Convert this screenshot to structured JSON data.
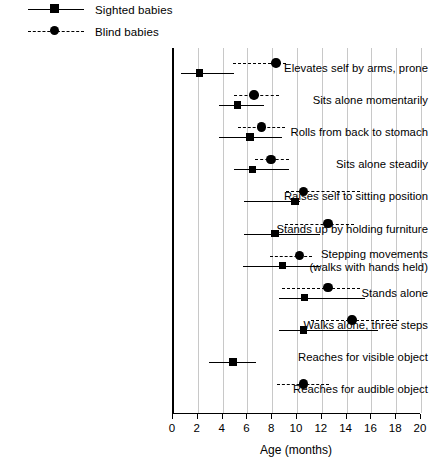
{
  "legend": {
    "position": "top-left",
    "entries": [
      {
        "label": "Sighted babies",
        "marker": "square",
        "line": "solid",
        "color": "#000000"
      },
      {
        "label": "Blind babies",
        "marker": "circle",
        "line": "dashed",
        "color": "#000000"
      }
    ]
  },
  "axis": {
    "xlabel": "Age (months)",
    "ticks": [
      "0",
      "2",
      "4",
      "6",
      "8",
      "10",
      "12",
      "14",
      "16",
      "18",
      "20"
    ]
  },
  "chart_data": {
    "type": "range-dot",
    "title": "",
    "xlabel": "Age (months)",
    "ylabel": "",
    "xlim": [
      0,
      20
    ],
    "grid": true,
    "legend_position": "top-left",
    "categories": [
      "Elevates self by arms, prone",
      "Sits alone momentarily",
      "Rolls from back to stomach",
      "Sits alone steadily",
      "Raises self to sitting position",
      "Stands up by holding furniture",
      "Stepping movements\n(walks with hands held)",
      "Stands alone",
      "Walks alone, three steps",
      "Reaches for visible object",
      "Reaches for audible object"
    ],
    "series": [
      {
        "name": "Sighted babies",
        "marker": "square",
        "line": "solid",
        "points": [
          {
            "category": "Elevates self by arms, prone",
            "median": 2.2,
            "low": 0.7,
            "high": 5.0
          },
          {
            "category": "Sits alone momentarily",
            "median": 5.3,
            "low": 3.8,
            "high": 7.4
          },
          {
            "category": "Rolls from back to stomach",
            "median": 6.3,
            "low": 3.8,
            "high": 8.9
          },
          {
            "category": "Sits alone steadily",
            "median": 6.5,
            "low": 5.0,
            "high": 9.4
          },
          {
            "category": "Raises self to sitting position",
            "median": 9.9,
            "low": 5.8,
            "high": 10.3
          },
          {
            "category": "Stands up by holding furniture",
            "median": 8.3,
            "low": 5.8,
            "high": 11.9
          },
          {
            "category": "Stepping movements\n(walks with hands held)",
            "median": 8.9,
            "low": 5.7,
            "high": 11.9
          },
          {
            "category": "Stands alone",
            "median": 10.7,
            "low": 8.6,
            "high": 15.6
          },
          {
            "category": "Walks alone, three steps",
            "median": 10.6,
            "low": 8.6,
            "high": 16.6
          },
          {
            "category": "Reaches for visible object",
            "median": 4.9,
            "low": 3.0,
            "high": 6.8
          }
        ]
      },
      {
        "name": "Blind babies",
        "marker": "circle",
        "line": "dashed",
        "points": [
          {
            "category": "Elevates self by arms, prone",
            "median": 8.4,
            "low": 4.9,
            "high": 9.2
          },
          {
            "category": "Sits alone momentarily",
            "median": 6.6,
            "low": 5.0,
            "high": 8.6
          },
          {
            "category": "Rolls from back to stomach",
            "median": 7.2,
            "low": 5.3,
            "high": 9.1
          },
          {
            "category": "Sits alone steadily",
            "median": 8.0,
            "low": 6.7,
            "high": 9.4
          },
          {
            "category": "Raises self to sitting position",
            "median": 10.6,
            "low": 9.2,
            "high": 15.2
          },
          {
            "category": "Stands up by holding furniture",
            "median": 12.6,
            "low": 9.1,
            "high": 14.7
          },
          {
            "category": "Stepping movements\n(walks with hands held)",
            "median": 10.3,
            "low": 7.9,
            "high": 11.3
          },
          {
            "category": "Stands alone",
            "median": 12.6,
            "low": 8.9,
            "high": 15.2
          },
          {
            "category": "Walks alone, three steps",
            "median": 14.5,
            "low": 11.2,
            "high": 18.3
          },
          {
            "category": "Reaches for audible object",
            "median": 10.6,
            "low": 8.5,
            "high": 12.7
          }
        ]
      }
    ]
  }
}
